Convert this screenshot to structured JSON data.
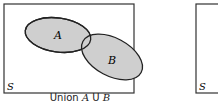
{
  "diagram": {
    "type": "venn",
    "panels": [
      {
        "universe_label": "S",
        "sets": [
          {
            "label": "A"
          },
          {
            "label": "B"
          }
        ],
        "caption": {
          "prefix": "Union",
          "expr_a": "A",
          "op": "U",
          "expr_b": "B"
        },
        "shaded": "A ∪ B"
      },
      {
        "universe_label": "S"
      }
    ],
    "colors": {
      "fill": "#cfcfcf",
      "stroke": "#222222",
      "frame": "#333333"
    }
  }
}
